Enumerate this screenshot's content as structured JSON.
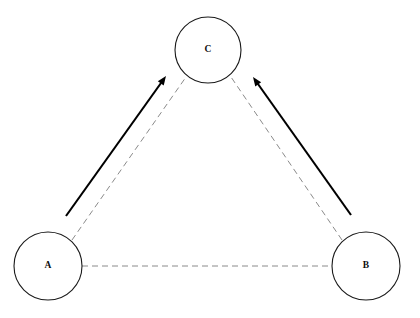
{
  "diagram": {
    "canvas": {
      "width": 420,
      "height": 318,
      "background": "#ffffff"
    },
    "colors": {
      "node_stroke": "#1a1a1a",
      "node_fill": "#ffffff",
      "label_color": "#0d0d0d",
      "dashed_edge": "#7d7d7d",
      "arrow_edge": "#000000"
    },
    "nodes": [
      {
        "id": "A",
        "label": "A",
        "cx": 48,
        "cy": 266,
        "r": 34
      },
      {
        "id": "B",
        "label": "B",
        "cx": 366,
        "cy": 266,
        "r": 34
      },
      {
        "id": "C",
        "label": "C",
        "cx": 208,
        "cy": 50,
        "r": 33
      }
    ],
    "dashed_edges": [
      {
        "id": "A-B",
        "from": "A",
        "to": "B",
        "x1": 82,
        "y1": 266,
        "x2": 332,
        "y2": 266
      },
      {
        "id": "A-C",
        "from": "A",
        "to": "C",
        "x1": 72,
        "y1": 240,
        "x2": 186,
        "y2": 77
      },
      {
        "id": "B-C",
        "from": "B",
        "to": "C",
        "x1": 342,
        "y1": 240,
        "x2": 231,
        "y2": 77
      }
    ],
    "arrows": [
      {
        "id": "A-to-C",
        "from": "A",
        "to": "C",
        "x1": 66,
        "y1": 216,
        "x2": 166,
        "y2": 76,
        "head_size": 9
      },
      {
        "id": "B-to-C",
        "from": "B",
        "to": "C",
        "x1": 351,
        "y1": 215,
        "x2": 253,
        "y2": 77,
        "head_size": 9
      }
    ]
  }
}
